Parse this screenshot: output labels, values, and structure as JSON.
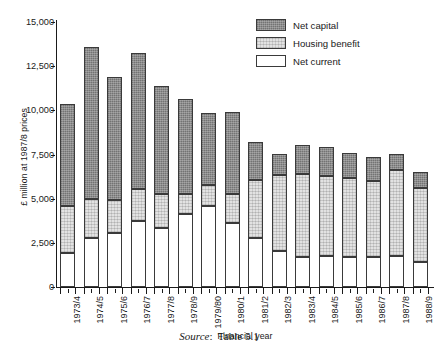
{
  "chart_data": {
    "type": "bar",
    "subtype": "stacked-vertical",
    "title": "",
    "xlabel": "Financial year",
    "ylabel": "£ million at 1987/8 prices",
    "ylim": [
      0,
      15000
    ],
    "ytick_values": [
      0,
      2500,
      5000,
      7500,
      10000,
      12500,
      15000
    ],
    "ytick_labels": [
      "0",
      "2,500",
      "5,000",
      "7,500",
      "10,000",
      "12,500",
      "15,000"
    ],
    "grid": false,
    "legend_position": "top-right",
    "categories": [
      "1973/4",
      "1974/5",
      "1975/6",
      "1976/7",
      "1977/8",
      "1978/9",
      "1979/80",
      "1980/1",
      "1981/2",
      "1982/3",
      "1983/4",
      "1984/5",
      "1985/6",
      "1986/7",
      "1987/8",
      "1988/9"
    ],
    "series": [
      {
        "name": "Net current",
        "fill": "white",
        "values": [
          1900,
          2800,
          3050,
          3750,
          3350,
          4150,
          4600,
          3650,
          2750,
          2050,
          1700,
          1750,
          1700,
          1700,
          1750,
          1400
        ]
      },
      {
        "name": "Housing benefit",
        "fill": "light-grey-hatch",
        "values": [
          2700,
          2200,
          1900,
          1800,
          1900,
          1100,
          1150,
          1600,
          3300,
          4300,
          4700,
          4550,
          4450,
          4300,
          4850,
          4200
        ]
      },
      {
        "name": "Net capital",
        "fill": "dark-grey-hatch",
        "values": [
          5750,
          8600,
          6950,
          7700,
          6150,
          5400,
          4100,
          4650,
          2150,
          1200,
          1650,
          1650,
          1450,
          1350,
          950,
          900
        ]
      }
    ],
    "totals": [
      10350,
      13600,
      11900,
      13250,
      11400,
      10650,
      9850,
      9900,
      8200,
      7550,
      8050,
      7950,
      7600,
      7350,
      7550,
      6500
    ]
  },
  "legend": {
    "entries": [
      {
        "label": "Net capital",
        "swatch": "dark-grey-hatch"
      },
      {
        "label": "Housing benefit",
        "swatch": "light-grey-hatch"
      },
      {
        "label": "Net current",
        "swatch": "white"
      }
    ]
  },
  "caption": {
    "source_word": "Source",
    "source_separator": ":",
    "source_ref": "Table 5.1"
  },
  "colors": {
    "net_capital": "#8c8c8c",
    "housing_benefit": "#e2e2e2",
    "net_current": "#ffffff",
    "axis": "#1a1a1a",
    "bar_outline": "#3a3a3a",
    "background": "#ffffff"
  }
}
